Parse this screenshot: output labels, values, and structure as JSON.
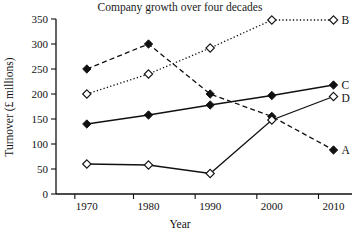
{
  "chart_data": {
    "type": "line",
    "title": "Company growth over four decades",
    "xlabel": "Year",
    "ylabel": "Turnover (£ millions)",
    "categories": [
      "1970",
      "1980",
      "1990",
      "2000",
      "2010"
    ],
    "x": [
      1970,
      1980,
      1990,
      2000,
      2010
    ],
    "xlim": [
      1965,
      2013
    ],
    "ylim": [
      0,
      350
    ],
    "yticks": [
      "0",
      "50",
      "100",
      "150",
      "200",
      "250",
      "300",
      "350"
    ],
    "ytick_values": [
      0,
      50,
      100,
      150,
      200,
      250,
      300,
      350
    ],
    "grid": false,
    "legend_position": "right-inline-labels",
    "series": [
      {
        "name": "A",
        "label": "A",
        "values": [
          250,
          300,
          200,
          155,
          88
        ],
        "line_style": "dashed",
        "marker": "filled-diamond"
      },
      {
        "name": "B",
        "label": "B",
        "values": [
          200,
          240,
          292,
          348,
          348
        ],
        "line_style": "dotted",
        "marker": "open-diamond"
      },
      {
        "name": "C",
        "label": "C",
        "values": [
          140,
          158,
          178,
          197,
          218
        ],
        "line_style": "solid",
        "marker": "filled-diamond"
      },
      {
        "name": "D",
        "label": "D",
        "values": [
          60,
          58,
          41,
          148,
          195
        ],
        "line_style": "solid",
        "marker": "open-diamond"
      }
    ]
  },
  "colors": {
    "ink": "#111111",
    "background": "#ffffff"
  }
}
